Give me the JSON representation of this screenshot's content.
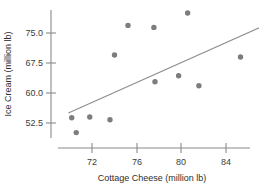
{
  "chart_data": {
    "type": "scatter",
    "title": "",
    "xlabel": "Cottage Cheese (million lb)",
    "ylabel": "Ice Cream (million lb)",
    "xlim": [
      69.5,
      86.3
    ],
    "ylim": [
      48.5,
      80.5
    ],
    "xticks": [
      72,
      76,
      80,
      84
    ],
    "xtick_labels": [
      "72",
      "76",
      "80",
      "84"
    ],
    "yticks": [
      52.5,
      60.0,
      67.5,
      75.0
    ],
    "ytick_labels": [
      "52.5",
      "60.0",
      "67.5",
      "75.0"
    ],
    "grid": false,
    "legend": false,
    "point_color": "#7d7d7d",
    "line_color": "#8d8d8d",
    "axis_color": "#8a8a8a",
    "points": [
      {
        "x": 70.2,
        "y": 53.8
      },
      {
        "x": 70.6,
        "y": 50.1
      },
      {
        "x": 71.8,
        "y": 54.0
      },
      {
        "x": 73.6,
        "y": 53.3
      },
      {
        "x": 74.0,
        "y": 69.5
      },
      {
        "x": 75.2,
        "y": 76.9
      },
      {
        "x": 77.5,
        "y": 76.4
      },
      {
        "x": 77.6,
        "y": 62.8
      },
      {
        "x": 79.7,
        "y": 64.3
      },
      {
        "x": 80.5,
        "y": 80.0
      },
      {
        "x": 81.5,
        "y": 61.8
      },
      {
        "x": 85.2,
        "y": 69.0
      }
    ],
    "fit_line": {
      "x_start": 69.9,
      "y_start": 55.0,
      "x_end": 87.0,
      "y_end": 76.5
    }
  }
}
